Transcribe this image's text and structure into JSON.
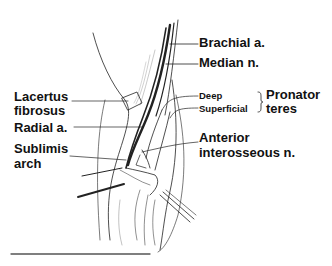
{
  "figure": {
    "type": "anatomical-line-drawing"
  },
  "labels": {
    "brachial": "Brachial a.",
    "median": "Median n.",
    "deep": "Deep",
    "superficial": "Superficial",
    "pronator_1": "Pronator",
    "pronator_2": "teres",
    "anterior_1": "Anterior",
    "anterior_2": "interosseous n.",
    "lacertus_1": "Lacertus",
    "lacertus_2": "fibrosus",
    "radial": "Radial a.",
    "sublimis_1": "Sublimis",
    "sublimis_2": "arch"
  },
  "colors": {
    "ink": "#111111",
    "background": "#ffffff",
    "rule": "#555555"
  }
}
